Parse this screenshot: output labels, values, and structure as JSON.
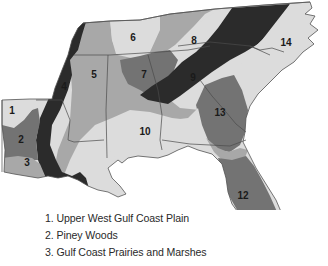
{
  "map": {
    "title": "",
    "colors": {
      "light": "#dcdcdc",
      "medium": "#a8a8a8",
      "dark_medium": "#737373",
      "dark": "#2b2b2b",
      "state_border": "#4a4a4a",
      "background": "#ffffff"
    },
    "regions": [
      {
        "id": "1",
        "label": "1",
        "shade": "light"
      },
      {
        "id": "2",
        "label": "2",
        "shade": "dark_medium"
      },
      {
        "id": "3",
        "label": "3",
        "shade": "medium"
      },
      {
        "id": "4",
        "label": "4",
        "shade": "dark"
      },
      {
        "id": "5",
        "label": "5",
        "shade": "medium"
      },
      {
        "id": "6",
        "label": "6",
        "shade": "light"
      },
      {
        "id": "7",
        "label": "7",
        "shade": "dark_medium"
      },
      {
        "id": "8",
        "label": "8",
        "shade": "light"
      },
      {
        "id": "9",
        "label": "9",
        "shade": "dark"
      },
      {
        "id": "10",
        "label": "10",
        "shade": "light"
      },
      {
        "id": "11",
        "label": "11",
        "shade": "light"
      },
      {
        "id": "12",
        "label": "12",
        "shade": "dark_medium"
      },
      {
        "id": "13",
        "label": "13",
        "shade": "dark_medium"
      },
      {
        "id": "14",
        "label": "14",
        "shade": "light"
      }
    ]
  },
  "legend": {
    "items": [
      "1.  Upper West Gulf Coast Plain",
      "2.  Piney Woods",
      "3.  Gulf Coast Prairies and Marshes"
    ]
  }
}
